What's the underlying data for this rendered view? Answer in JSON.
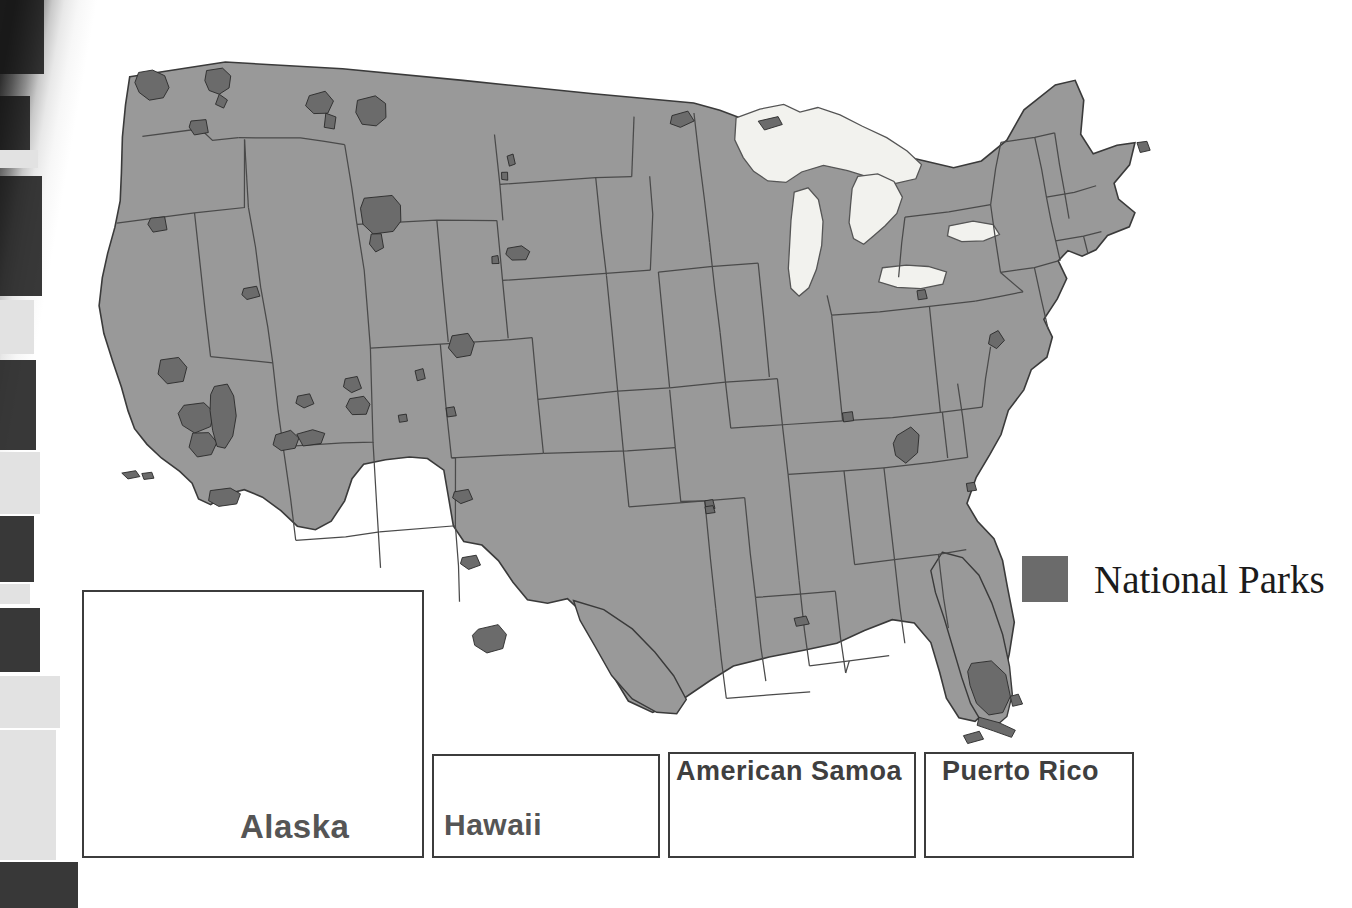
{
  "page": {
    "kind": "printed-map-scan",
    "title_visible": false,
    "background_color": "#ffffff",
    "gutter_present": true
  },
  "map": {
    "name": "United States National Parks map",
    "base_fill": "#999999",
    "park_fill": "#6b6b6b",
    "border_color": "#4a4a4a",
    "lake_fill": "#f2f2ee",
    "lake_border": "#555555",
    "outline_color": "#3a3a3a"
  },
  "legend": {
    "label": "National Parks",
    "swatch_color": "#6b6b6b",
    "text_color": "#1b1b1b"
  },
  "insets": [
    {
      "id": "alaska",
      "label": "Alaska",
      "label_position": "bottom-right",
      "border_color": "#3c3c3c",
      "x": 82,
      "y": 590,
      "w": 342,
      "h": 268
    },
    {
      "id": "hawaii",
      "label": "Hawaii",
      "label_position": "bottom-left",
      "border_color": "#3c3c3c",
      "x": 432,
      "y": 754,
      "w": 228,
      "h": 104
    },
    {
      "id": "american-samoa",
      "label": "American Samoa",
      "label_position": "top-left",
      "border_color": "#3c3c3c",
      "x": 668,
      "y": 752,
      "w": 248,
      "h": 106
    },
    {
      "id": "puerto-rico",
      "label": "Puerto Rico",
      "label_position": "top-left",
      "border_color": "#3c3c3c",
      "x": 924,
      "y": 752,
      "w": 210,
      "h": 106
    }
  ],
  "park_markers": {
    "description": "Dark gray polygons marking National Park areas on the contiguous map",
    "count_visible": 48
  }
}
